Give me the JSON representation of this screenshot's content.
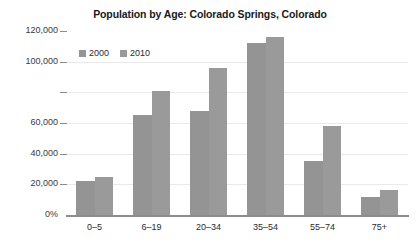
{
  "chart_data": {
    "type": "bar",
    "title": "Population by Age: Colorado Springs, Colorado",
    "xlabel": "",
    "ylabel": "",
    "categories": [
      "0–5",
      "6–19",
      "20–34",
      "35–54",
      "55–74",
      "75+"
    ],
    "series": [
      {
        "name": "2000",
        "values": [
          22000,
          65000,
          68000,
          112000,
          35000,
          12000
        ]
      },
      {
        "name": "2010",
        "values": [
          25000,
          81000,
          96000,
          116000,
          58000,
          16000
        ]
      }
    ],
    "ylim": [
      0,
      120000
    ],
    "ytick_values": [
      0,
      20000,
      40000,
      60000,
      80000,
      100000,
      120000
    ],
    "ytick_labels": [
      "0%",
      "20,000",
      "40,000",
      "60,000",
      "80,000",
      "100,000",
      "120,000"
    ],
    "ytick_labels_visible": [
      true,
      true,
      true,
      true,
      false,
      true,
      true
    ],
    "grid": true,
    "legend_position": "upper-left-inside",
    "bar_color": "#949494",
    "grid_color": "#e9e9e9",
    "axis_color": "#8c8c8c"
  },
  "legend": {
    "items": [
      {
        "label": "2000",
        "color": "#949494"
      },
      {
        "label": "2010",
        "color": "#9a9a9a"
      }
    ]
  }
}
